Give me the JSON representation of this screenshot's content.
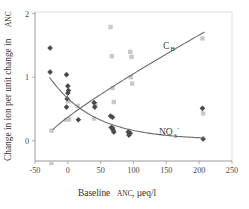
{
  "chart_data": {
    "type": "scatter",
    "title": "",
    "xlabel": "Baseline ANC, µeq/l",
    "xlabel_main": "Baseline",
    "xlabel_smallcaps": "ANC",
    "xlabel_units": ", µeq/l",
    "ylabel": "Change in ion per unit change in ANC",
    "ylabel_main_a": "Change in ion per unit change in",
    "ylabel_smallcaps": "ANC",
    "xlim": [
      -50,
      250
    ],
    "ylim": [
      -0.45,
      2.05
    ],
    "xticks": [
      -50,
      0,
      50,
      100,
      150,
      200,
      250
    ],
    "xticklabels": [
      "-50",
      "0",
      "50",
      "100",
      "150",
      "200",
      "250"
    ],
    "yticks": [
      0,
      1,
      2
    ],
    "yticklabels": [
      "0",
      "1",
      "2"
    ],
    "grid": false,
    "legend_position": "inline-annotation",
    "series": [
      {
        "name": "C_B",
        "label": "C",
        "label_sub": "B",
        "marker": "square",
        "color": "#c9c9c9",
        "annotation_x": 150,
        "annotation_y": 1.47,
        "points": [
          {
            "x": -25,
            "y": 0.16
          },
          {
            "x": -25,
            "y": -0.35
          },
          {
            "x": -2,
            "y": 0.33
          },
          {
            "x": 2,
            "y": 0.34
          },
          {
            "x": 0,
            "y": 0.63
          },
          {
            "x": 1,
            "y": 0.62
          },
          {
            "x": 15,
            "y": 0.55
          },
          {
            "x": 40,
            "y": 0.35
          },
          {
            "x": 42,
            "y": 0.58
          },
          {
            "x": 65,
            "y": 1.79
          },
          {
            "x": 67,
            "y": 1.33
          },
          {
            "x": 68,
            "y": 0.83
          },
          {
            "x": 70,
            "y": 0.61
          },
          {
            "x": 95,
            "y": 1.4
          },
          {
            "x": 97,
            "y": 1.32
          },
          {
            "x": 96,
            "y": 1.0
          },
          {
            "x": 98,
            "y": 0.9
          },
          {
            "x": 205,
            "y": 1.61
          },
          {
            "x": 206,
            "y": 0.43
          }
        ]
      },
      {
        "name": "NO3-",
        "label": "NO",
        "label_sub": "3",
        "label_sup": "-",
        "marker": "diamond",
        "color": "#4a4a4a",
        "annotation_x": 150,
        "annotation_y": 0.09,
        "points": [
          {
            "x": -27,
            "y": 1.46
          },
          {
            "x": -27,
            "y": 1.08
          },
          {
            "x": -2,
            "y": 1.04
          },
          {
            "x": 0,
            "y": 0.86
          },
          {
            "x": 1,
            "y": 0.79
          },
          {
            "x": 0,
            "y": 0.75
          },
          {
            "x": -1,
            "y": 0.66
          },
          {
            "x": -2,
            "y": 0.53
          },
          {
            "x": 16,
            "y": 0.33
          },
          {
            "x": 40,
            "y": 0.6
          },
          {
            "x": 41,
            "y": 0.53
          },
          {
            "x": 65,
            "y": 0.39
          },
          {
            "x": 68,
            "y": 0.37
          },
          {
            "x": 66,
            "y": 0.21
          },
          {
            "x": 68,
            "y": 0.2
          },
          {
            "x": 69,
            "y": 0.17
          },
          {
            "x": 70,
            "y": 0.14
          },
          {
            "x": 92,
            "y": 0.14
          },
          {
            "x": 95,
            "y": 0.12
          },
          {
            "x": 93,
            "y": 0.09
          },
          {
            "x": 205,
            "y": 0.51
          },
          {
            "x": 206,
            "y": 0.03
          }
        ]
      }
    ],
    "fit_curves": [
      {
        "name": "C_B fit",
        "type": "increasing",
        "x_start": -23,
        "x_end": 208,
        "y_start": 0.17,
        "y_end": 1.71
      },
      {
        "name": "NO3- fit",
        "type": "decaying",
        "x_start": -28,
        "x_end": 208,
        "y_start": 1.0,
        "y_end": 0.03
      }
    ]
  }
}
